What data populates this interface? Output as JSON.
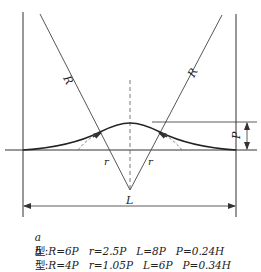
{
  "diagram": {
    "labels": {
      "left_line": "R",
      "right_line": "R",
      "left_radius": "r",
      "right_radius": "r",
      "apex": "L",
      "height": "P"
    },
    "colors": {
      "stroke": "#333333",
      "background": "#ffffff"
    }
  },
  "legend": [
    {
      "type": "a",
      "type_suffix": "型",
      "R": "R=6P",
      "r": "r=2.5P",
      "L": "L=8P",
      "P": "P=0.24H"
    },
    {
      "type": "b",
      "type_suffix": "型",
      "R": "R=4P",
      "r": "r=1.05P",
      "L": "L=6P",
      "P": "P=0.34H"
    }
  ]
}
